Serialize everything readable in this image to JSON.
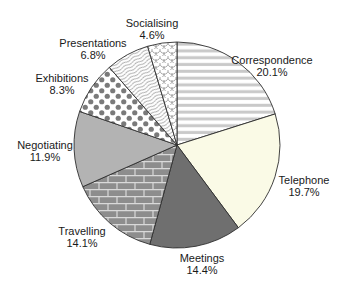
{
  "chart_data": {
    "type": "pie",
    "title": "",
    "direction": "clockwise",
    "start_angle_deg": 0,
    "legend_position": "none",
    "geometry": {
      "cx": 177,
      "cy": 145,
      "r": 103
    },
    "slices": [
      {
        "label": "Correspondence",
        "value": 20.1,
        "pct_label": "20.1%",
        "pattern": "horizontal-stripes",
        "label_x": 272,
        "label_y": 64
      },
      {
        "label": "Telephone",
        "value": 19.7,
        "pct_label": "19.7%",
        "pattern": "solid-cream",
        "label_x": 304,
        "label_y": 184
      },
      {
        "label": "Meetings",
        "value": 14.4,
        "pct_label": "14.4%",
        "pattern": "solid-dark-gray",
        "label_x": 202,
        "label_y": 262
      },
      {
        "label": "Travelling",
        "value": 14.1,
        "pct_label": "14.1%",
        "pattern": "brick",
        "label_x": 82,
        "label_y": 235
      },
      {
        "label": "Negotiating",
        "value": 11.9,
        "pct_label": "11.9%",
        "pattern": "solid-medium-gray",
        "label_x": 45,
        "label_y": 149
      },
      {
        "label": "Exhibitions",
        "value": 8.3,
        "pct_label": "8.3%",
        "pattern": "polka-dots",
        "label_x": 62,
        "label_y": 82
      },
      {
        "label": "Presentations",
        "value": 6.8,
        "pct_label": "6.8%",
        "pattern": "wavy-lines",
        "label_x": 93,
        "label_y": 47
      },
      {
        "label": "Socialising",
        "value": 4.6,
        "pct_label": "4.6%",
        "pattern": "fish-scales",
        "label_x": 152,
        "label_y": 27
      }
    ],
    "colors": {
      "background": "#ffffff",
      "stripe_gray": "#c9c9c9",
      "cream": "#fafae6",
      "dark_gray": "#6f6f6f",
      "brick_gray": "#8d8d8d",
      "brick_mortar": "#d9d9d9",
      "medium_gray": "#b3b3b3",
      "dot_gray": "#7a7a7a",
      "wave_line": "#b0b0b0",
      "scale_line": "#999999",
      "outline": "#2e2e2e",
      "label_text": "#1a1a1a"
    }
  }
}
